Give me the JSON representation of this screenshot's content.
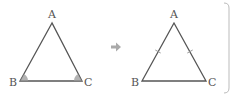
{
  "colors": {
    "line": "#555555",
    "angle_marker": "#9a9a9a",
    "arrow": "#aaaaaa",
    "bracket": "#bbbbbb",
    "label": "#555555"
  },
  "left_triangle": {
    "labels": {
      "a": "A",
      "b": "B",
      "c": "C"
    },
    "note": "base angles B and C marked equal"
  },
  "arrow": {
    "icon": "right-arrow-icon"
  },
  "right_triangle": {
    "labels": {
      "a": "A",
      "b": "B",
      "c": "C"
    },
    "note": "sides AB and AC marked equal"
  }
}
